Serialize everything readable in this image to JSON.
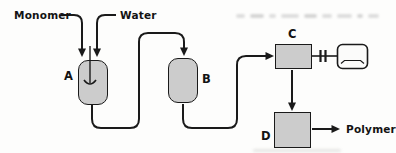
{
  "diagram": {
    "type": "process-flow",
    "inputs": [
      {
        "label": "Monomer"
      },
      {
        "label": "Water"
      }
    ],
    "units": [
      {
        "label": "A",
        "kind": "stirred-vessel"
      },
      {
        "label": "B",
        "kind": "vessel"
      },
      {
        "label": "C",
        "kind": "unit-with-motor-drive"
      },
      {
        "label": "D",
        "kind": "unit"
      }
    ],
    "output": {
      "label": "Polymer"
    },
    "colors": {
      "line": "#1a1a1a",
      "vessel_fill": "#cccccc",
      "motor_fill": "#fbfbfa",
      "background": "#fdfdfc",
      "bleed_through": "#d4d4d4"
    }
  }
}
